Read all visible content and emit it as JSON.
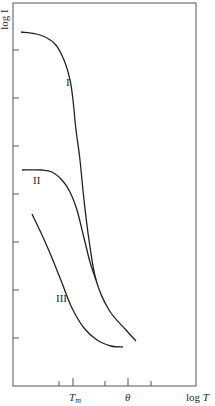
{
  "chart_data": {
    "type": "line",
    "title": "",
    "xlabel": "log T",
    "ylabel": "log I",
    "x_ticks": [
      {
        "pos": 59,
        "label": ""
      },
      {
        "pos": 73,
        "label": "Tm",
        "major": true
      },
      {
        "pos": 105,
        "label": ""
      },
      {
        "pos": 128,
        "label": "θ",
        "major": true
      },
      {
        "pos": 151,
        "label": ""
      }
    ],
    "y_ticks": [
      50,
      98,
      146,
      194,
      242,
      290,
      338
    ],
    "frame": {
      "left": 13,
      "top": 3,
      "right": 196,
      "bottom": 386
    },
    "grid": false,
    "series": [
      {
        "name": "I",
        "label_pos": [
          66,
          82
        ],
        "points": [
          [
            21,
            32
          ],
          [
            40,
            35
          ],
          [
            55,
            44
          ],
          [
            64,
            60
          ],
          [
            70,
            80
          ],
          [
            73,
            100
          ],
          [
            76,
            130
          ],
          [
            80,
            160
          ],
          [
            84,
            200
          ],
          [
            89,
            240
          ],
          [
            96,
            280
          ],
          [
            109,
            310
          ],
          [
            126,
            330
          ],
          [
            136,
            341
          ]
        ]
      },
      {
        "name": "II",
        "label_pos": [
          33,
          180
        ],
        "points": [
          [
            22,
            170
          ],
          [
            42,
            170
          ],
          [
            52,
            172
          ],
          [
            62,
            180
          ],
          [
            70,
            192
          ],
          [
            77,
            210
          ],
          [
            84,
            238
          ],
          [
            90,
            262
          ],
          [
            96,
            280
          ]
        ]
      },
      {
        "name": "III",
        "label_pos": [
          56,
          298
        ],
        "points": [
          [
            32,
            214
          ],
          [
            42,
            235
          ],
          [
            52,
            258
          ],
          [
            62,
            283
          ],
          [
            72,
            308
          ],
          [
            84,
            328
          ],
          [
            97,
            340
          ],
          [
            111,
            346
          ],
          [
            123,
            347
          ]
        ]
      }
    ]
  },
  "axis": {
    "ylabel": "log I",
    "xlabel": "log",
    "xlabel_var": "T",
    "tick_tm_main": "T",
    "tick_tm_sub": "m",
    "tick_theta": "θ"
  },
  "curve_labels": {
    "one": "I",
    "two": "II",
    "three": "III"
  }
}
